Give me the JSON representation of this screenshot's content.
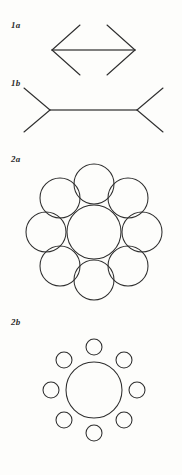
{
  "plate": {
    "width": 182,
    "height": 475,
    "background": "#fdfdfb",
    "ink_color": "#2e2e2e",
    "shaft_color": "#555555"
  },
  "figures": [
    {
      "id": "1a",
      "label": "1a",
      "name": "muller-lyer-arrows-outward",
      "illusion": "Müller-Lyer",
      "shaft": {
        "x1": 52,
        "y1": 50,
        "x2": 135,
        "y2": 50,
        "length": 83
      },
      "fins": [
        {
          "from": [
            52,
            50
          ],
          "to": [
            80,
            25
          ]
        },
        {
          "from": [
            52,
            50
          ],
          "to": [
            80,
            75
          ]
        },
        {
          "from": [
            135,
            50
          ],
          "to": [
            107,
            25
          ]
        },
        {
          "from": [
            135,
            50
          ],
          "to": [
            107,
            75
          ]
        }
      ],
      "fin_direction": "outward-pointing"
    },
    {
      "id": "1b",
      "label": "1b",
      "name": "muller-lyer-arrows-inward",
      "illusion": "Müller-Lyer",
      "shaft": {
        "x1": 50,
        "y1": 110,
        "x2": 137,
        "y2": 110,
        "length": 87
      },
      "fins": [
        {
          "from": [
            50,
            110
          ],
          "to": [
            24,
            88
          ]
        },
        {
          "from": [
            50,
            110
          ],
          "to": [
            24,
            132
          ]
        },
        {
          "from": [
            137,
            110
          ],
          "to": [
            163,
            88
          ]
        },
        {
          "from": [
            137,
            110
          ],
          "to": [
            163,
            132
          ]
        }
      ],
      "fin_direction": "inward-pointing"
    },
    {
      "id": "2a",
      "label": "2a",
      "name": "ebbinghaus-large-surround",
      "illusion": "Ebbinghaus",
      "center_circle": {
        "cx": 94,
        "cy": 232,
        "r": 27
      },
      "surround_count": 8,
      "surround_radius": 20,
      "surround_ring_radius": 48,
      "surround_circles": [
        {
          "cx": 94,
          "cy": 184,
          "r": 20
        },
        {
          "cx": 128,
          "cy": 198,
          "r": 20
        },
        {
          "cx": 142,
          "cy": 232,
          "r": 20
        },
        {
          "cx": 128,
          "cy": 266,
          "r": 20
        },
        {
          "cx": 94,
          "cy": 280,
          "r": 20
        },
        {
          "cx": 60,
          "cy": 266,
          "r": 20
        },
        {
          "cx": 46,
          "cy": 232,
          "r": 20
        },
        {
          "cx": 60,
          "cy": 198,
          "r": 20
        }
      ]
    },
    {
      "id": "2b",
      "label": "2b",
      "name": "ebbinghaus-small-surround",
      "illusion": "Ebbinghaus",
      "center_circle": {
        "cx": 94,
        "cy": 390,
        "r": 28
      },
      "surround_count": 8,
      "surround_radius": 8,
      "surround_ring_radius": 43,
      "surround_circles": [
        {
          "cx": 94,
          "cy": 347,
          "r": 8
        },
        {
          "cx": 124,
          "cy": 360,
          "r": 8
        },
        {
          "cx": 137,
          "cy": 390,
          "r": 8
        },
        {
          "cx": 124,
          "cy": 420,
          "r": 8
        },
        {
          "cx": 94,
          "cy": 433,
          "r": 8
        },
        {
          "cx": 64,
          "cy": 420,
          "r": 8
        },
        {
          "cx": 51,
          "cy": 390,
          "r": 8
        },
        {
          "cx": 64,
          "cy": 360,
          "r": 8
        }
      ]
    }
  ]
}
